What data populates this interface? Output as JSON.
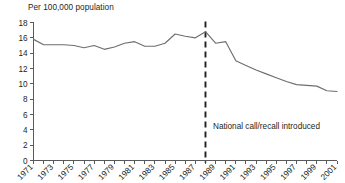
{
  "chart_data": {
    "type": "line",
    "title": "",
    "ylabel": "Per 100,000 population",
    "xlabel": "",
    "ylim": [
      0,
      18
    ],
    "ytick_step": 2,
    "yticks": [
      0,
      2,
      4,
      6,
      8,
      10,
      12,
      14,
      16,
      18
    ],
    "xlim": [
      1971,
      2001
    ],
    "xticks_all": [
      1971,
      1972,
      1973,
      1974,
      1975,
      1976,
      1977,
      1978,
      1979,
      1980,
      1981,
      1982,
      1983,
      1984,
      1985,
      1986,
      1987,
      1988,
      1989,
      1990,
      1991,
      1992,
      1993,
      1994,
      1995,
      1996,
      1997,
      1998,
      1999,
      2000,
      2001
    ],
    "xtick_labels": [
      "1971",
      "1973",
      "1975",
      "1977",
      "1979",
      "1981",
      "1983",
      "1985",
      "1987",
      "1989",
      "1991",
      "1993",
      "1995",
      "1997",
      "1999",
      "2001"
    ],
    "grid": false,
    "legend": "none",
    "x": [
      1971,
      1972,
      1973,
      1974,
      1975,
      1976,
      1977,
      1978,
      1979,
      1980,
      1981,
      1982,
      1983,
      1984,
      1985,
      1986,
      1987,
      1988,
      1989,
      1990,
      1991,
      1992,
      1993,
      1994,
      1995,
      1996,
      1997,
      1998,
      1999,
      2000,
      2001
    ],
    "values": [
      15.8,
      15.1,
      15.1,
      15.1,
      15.0,
      14.7,
      15.0,
      14.5,
      14.8,
      15.3,
      15.5,
      14.9,
      14.9,
      15.3,
      16.5,
      16.2,
      16.0,
      16.8,
      15.3,
      15.5,
      13.0,
      12.4,
      11.8,
      11.3,
      10.8,
      10.3,
      9.9,
      9.8,
      9.7,
      9.1,
      9.0
    ],
    "series_name": "Mortality rate",
    "line_color": "#6d6e71",
    "axis_color": "#58595b",
    "text_color": "#231f20",
    "background_color": "#ffffff",
    "annotations": [
      {
        "name": "national-call-recall",
        "text": "National call/recall introduced",
        "x": 1988,
        "marker": "vertical-dashed-line",
        "marker_color": "#231f20"
      }
    ]
  }
}
